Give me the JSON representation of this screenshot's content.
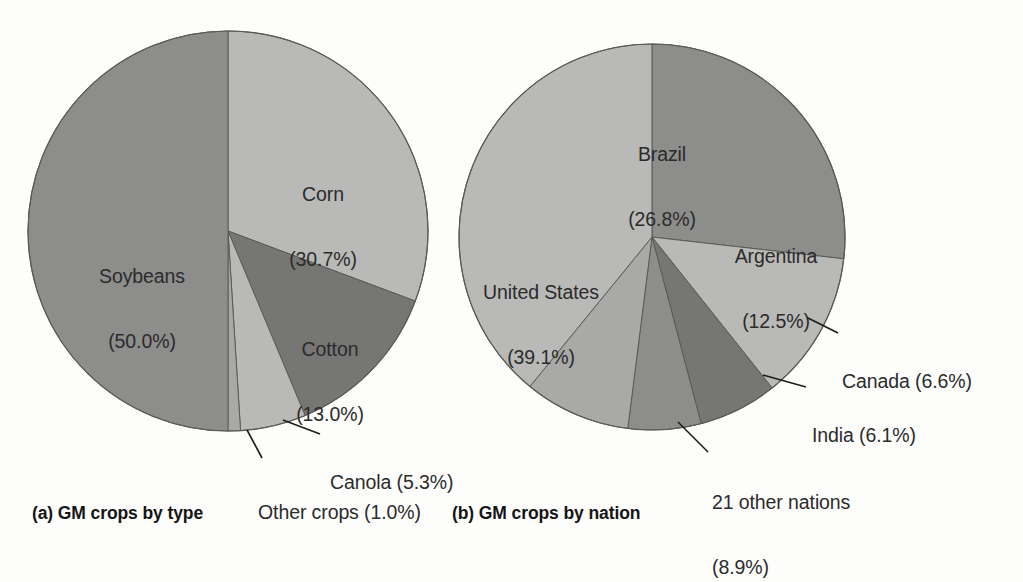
{
  "figure": {
    "panels": [
      {
        "key": "a",
        "caption": "(a) GM crops by type"
      },
      {
        "key": "b",
        "caption": "(b) GM crops by nation"
      }
    ]
  },
  "palette": {
    "light": "#b9b9b7",
    "medium_light": "#a9a9a7",
    "medium": "#8d8d8b",
    "dark": "#767674",
    "outline": "#5a5a58",
    "leader": "#1d1d1d",
    "text": "#2b2b2b",
    "background": "#fdfdfc"
  },
  "chart_data": [
    {
      "type": "pie",
      "id": "gm-crops-by-type",
      "title": "(a) GM crops by type",
      "start_angle_deg": 0,
      "direction": "clockwise",
      "center": [
        228,
        231
      ],
      "radius": 200,
      "categories": [
        "Corn",
        "Cotton",
        "Canola",
        "Other crops",
        "Soybeans"
      ],
      "values": [
        30.7,
        13.0,
        5.3,
        1.0,
        50.0
      ],
      "unit": "%",
      "slices": [
        {
          "label": "Corn",
          "value": 30.7,
          "value_text": "(30.7%)",
          "label_text": "Corn",
          "color": "#b9b9b7",
          "label_mode": "inside",
          "label_x": 323,
          "label_y": 140,
          "leader": null
        },
        {
          "label": "Cotton",
          "value": 13.0,
          "value_text": "(13.0%)",
          "label_text": "Cotton",
          "color": "#767674",
          "label_mode": "inside",
          "label_x": 330,
          "label_y": 295,
          "leader": null
        },
        {
          "label": "Canola",
          "value": 5.3,
          "value_text": "(5.3%)",
          "label_text": "Canola (5.3%)",
          "color": "#b9b9b7",
          "label_mode": "outside",
          "label_x": 330,
          "label_y": 428,
          "leader": [
            [
              283,
              420
            ],
            [
              320,
              434
            ]
          ]
        },
        {
          "label": "Other crops",
          "value": 1.0,
          "value_text": "(1.0%)",
          "label_text": "Other crops (1.0%)",
          "color": "#a9a9a7",
          "label_mode": "outside",
          "label_x": 258,
          "label_y": 458,
          "leader": [
            [
              247,
              430
            ],
            [
              262,
              458
            ]
          ]
        },
        {
          "label": "Soybeans",
          "value": 50.0,
          "value_text": "(50.0%)",
          "label_text": "Soybeans",
          "color": "#8d8d8b",
          "label_mode": "inside",
          "label_x": 142,
          "label_y": 222,
          "leader": null
        }
      ]
    },
    {
      "type": "pie",
      "id": "gm-crops-by-nation",
      "title": "(b) GM crops by nation",
      "start_angle_deg": 0,
      "direction": "clockwise",
      "center": [
        652,
        237
      ],
      "radius": 193,
      "categories": [
        "Brazil",
        "Argentina",
        "Canada",
        "India",
        "21 other nations",
        "United States"
      ],
      "values": [
        26.8,
        12.5,
        6.6,
        6.1,
        8.9,
        39.1
      ],
      "unit": "%",
      "slices": [
        {
          "label": "Brazil",
          "value": 26.8,
          "value_text": "(26.8%)",
          "label_text": "Brazil",
          "color": "#8d8d8b",
          "label_mode": "inside",
          "label_x": 662,
          "label_y": 100,
          "leader": null
        },
        {
          "label": "Argentina",
          "value": 12.5,
          "value_text": "(12.5%)",
          "label_text": "Argentina",
          "color": "#b9b9b7",
          "label_mode": "inside",
          "label_x": 776,
          "label_y": 202,
          "leader": null
        },
        {
          "label": "Canada",
          "value": 6.6,
          "value_text": "(6.6%)",
          "label_text": "Canada (6.6%)",
          "color": "#767674",
          "label_mode": "outside",
          "label_x": 842,
          "label_y": 327,
          "leader": [
            [
              808,
              318
            ],
            [
              838,
              333
            ]
          ]
        },
        {
          "label": "India",
          "value": 6.1,
          "value_text": "(6.1%)",
          "label_text": "India (6.1%)",
          "color": "#8d8d8b",
          "label_mode": "outside",
          "label_x": 812,
          "label_y": 381,
          "leader": [
            [
              763,
              375
            ],
            [
              806,
              387
            ]
          ]
        },
        {
          "label": "21 other nations",
          "value": 8.9,
          "value_text": "(8.9%)",
          "label_text": "21 other nations",
          "color": "#a9a9a7",
          "label_mode": "outside",
          "label_x": 712,
          "label_y": 448,
          "leader": [
            [
              678,
              422
            ],
            [
              708,
              452
            ]
          ]
        },
        {
          "label": "United States",
          "value": 39.1,
          "value_text": "(39.1%)",
          "label_text": "United States",
          "color": "#b9b9b7",
          "label_mode": "inside",
          "label_x": 541,
          "label_y": 238,
          "leader": null
        }
      ]
    }
  ]
}
